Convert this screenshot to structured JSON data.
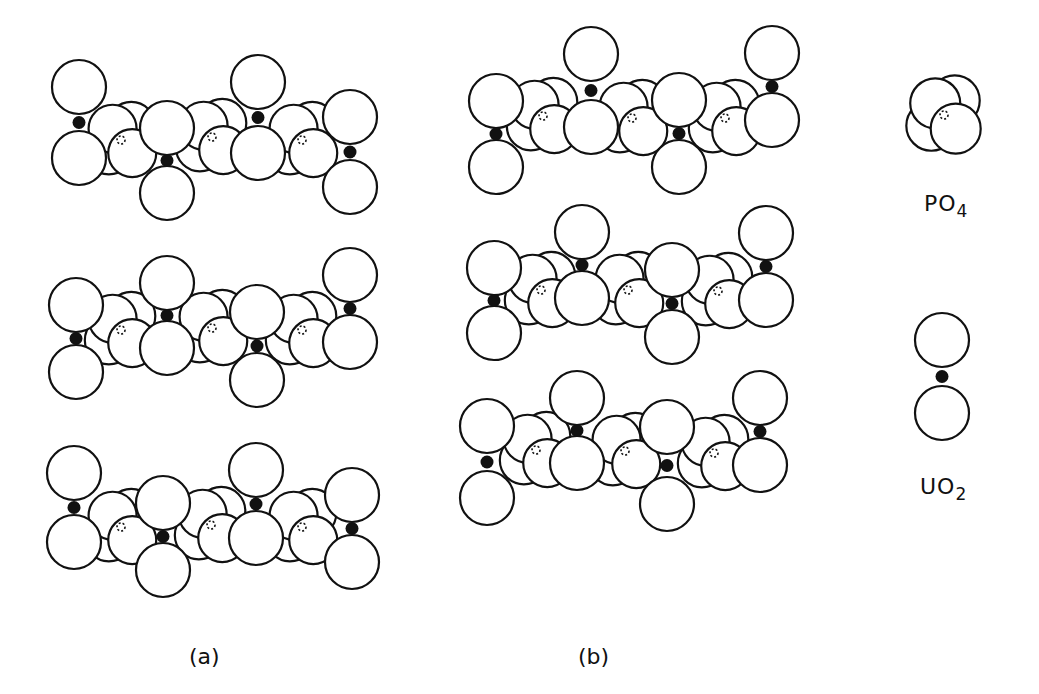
{
  "figure": {
    "panels": [
      {
        "id": "a",
        "label": "(a)",
        "label_pos": [
          201,
          668
        ]
      },
      {
        "id": "b",
        "label": "(b)",
        "label_pos": [
          592,
          668
        ]
      }
    ],
    "legend": {
      "po4": {
        "formula_main": "PO",
        "formula_sub": "4",
        "label": "PO4"
      },
      "uo2": {
        "formula_main": "UO",
        "formula_sub": "2",
        "label": "UO2"
      }
    }
  },
  "style": {
    "stroke_color": "#111111",
    "fill_color": "#ffffff",
    "atom_color": "#111111",
    "stroke_width": 2.2,
    "oxygen_radius": 27,
    "po4_radius": 24
  },
  "layers": [
    {
      "panel": "a",
      "row": 1,
      "uo2": [
        [
          79,
          87,
          79,
          158
        ],
        [
          167,
          128,
          167,
          193
        ],
        [
          258,
          82,
          258,
          153
        ],
        [
          350,
          117,
          350,
          187
        ]
      ],
      "po4": [
        [
          121,
          140
        ],
        [
          212,
          137
        ],
        [
          302,
          140
        ]
      ]
    },
    {
      "panel": "a",
      "row": 2,
      "uo2": [
        [
          76,
          305,
          76,
          372
        ],
        [
          167,
          283,
          167,
          348
        ],
        [
          257,
          312,
          257,
          380
        ],
        [
          350,
          275,
          350,
          342
        ]
      ],
      "po4": [
        [
          121,
          330
        ],
        [
          212,
          328
        ],
        [
          302,
          330
        ]
      ]
    },
    {
      "panel": "a",
      "row": 3,
      "uo2": [
        [
          74,
          473,
          74,
          542
        ],
        [
          163,
          503,
          163,
          570
        ],
        [
          256,
          470,
          256,
          538
        ],
        [
          352,
          495,
          352,
          562
        ]
      ],
      "po4": [
        [
          121,
          527
        ],
        [
          211,
          525
        ],
        [
          302,
          527
        ]
      ]
    },
    {
      "panel": "b",
      "row": 1,
      "uo2": [
        [
          496,
          101,
          496,
          167
        ],
        [
          591,
          54,
          591,
          127
        ],
        [
          679,
          100,
          679,
          167
        ],
        [
          772,
          53,
          772,
          120
        ]
      ],
      "po4": [
        [
          543,
          116
        ],
        [
          632,
          118
        ],
        [
          725,
          118
        ]
      ]
    },
    {
      "panel": "b",
      "row": 2,
      "uo2": [
        [
          494,
          268,
          494,
          333
        ],
        [
          582,
          232,
          582,
          298
        ],
        [
          672,
          270,
          672,
          337
        ],
        [
          766,
          233,
          766,
          300
        ]
      ],
      "po4": [
        [
          541,
          290
        ],
        [
          628,
          290
        ],
        [
          718,
          291
        ]
      ]
    },
    {
      "panel": "b",
      "row": 3,
      "uo2": [
        [
          487,
          426,
          487,
          498
        ],
        [
          577,
          398,
          577,
          463
        ],
        [
          667,
          427,
          667,
          504
        ],
        [
          760,
          398,
          760,
          465
        ]
      ],
      "po4": [
        [
          536,
          450
        ],
        [
          625,
          451
        ],
        [
          714,
          453
        ]
      ]
    }
  ],
  "legend_shapes": {
    "po4_center": [
      944,
      115
    ],
    "uo2": [
      942,
      340,
      942,
      413
    ]
  }
}
